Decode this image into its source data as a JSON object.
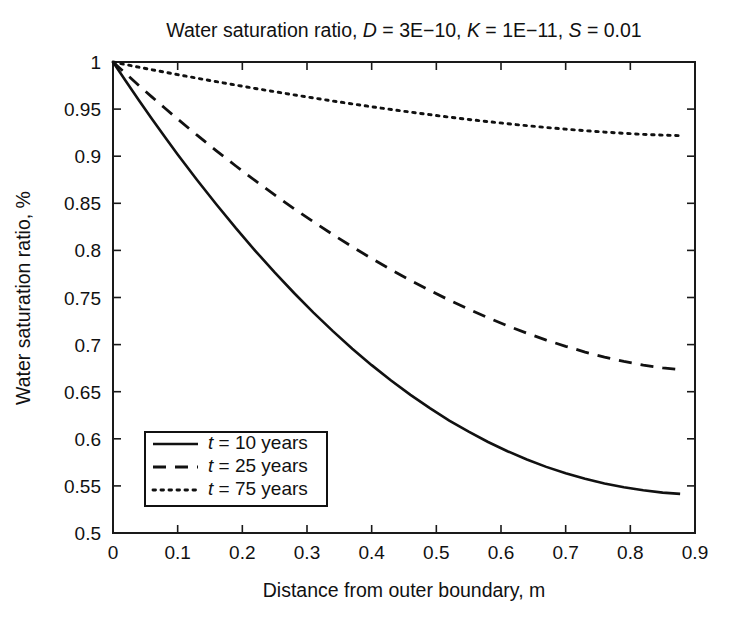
{
  "chart_data": {
    "type": "line",
    "title": "Water saturation ratio, D = 3E−10, K = 1E−11, S = 0.01",
    "title_parts": [
      {
        "text": "Water saturation ratio, ",
        "italic": false
      },
      {
        "text": "D",
        "italic": true
      },
      {
        "text": " = 3E−10, ",
        "italic": false
      },
      {
        "text": "K",
        "italic": true
      },
      {
        "text": " = 1E−11, ",
        "italic": false
      },
      {
        "text": "S",
        "italic": true
      },
      {
        "text": " = 0.01",
        "italic": false
      }
    ],
    "xlabel": "Distance from outer boundary, m",
    "ylabel": "Water saturation ratio, %",
    "xlim": [
      0,
      0.9
    ],
    "ylim": [
      0.5,
      1
    ],
    "xticks": [
      0,
      0.1,
      0.2,
      0.3,
      0.4,
      0.5,
      0.6,
      0.7,
      0.8,
      0.9
    ],
    "xtick_labels": [
      "0",
      "0.1",
      "0.2",
      "0.3",
      "0.4",
      "0.5",
      "0.6",
      "0.7",
      "0.8",
      "0.9"
    ],
    "yticks": [
      0.5,
      0.55,
      0.6,
      0.65,
      0.7,
      0.75,
      0.8,
      0.85,
      0.9,
      0.95,
      1
    ],
    "ytick_labels": [
      "0.5",
      "0.55",
      "0.6",
      "0.65",
      "0.7",
      "0.75",
      "0.8",
      "0.85",
      "0.9",
      "0.95",
      "1"
    ],
    "grid": false,
    "legend_position": "lower-left-inside",
    "x": [
      0,
      0.02,
      0.04,
      0.06,
      0.08,
      0.1,
      0.13,
      0.16,
      0.19,
      0.22,
      0.25,
      0.28,
      0.31,
      0.34,
      0.37,
      0.4,
      0.43,
      0.46,
      0.49,
      0.52,
      0.55,
      0.58,
      0.61,
      0.64,
      0.67,
      0.7,
      0.73,
      0.76,
      0.79,
      0.82,
      0.85,
      0.877
    ],
    "series": [
      {
        "name": "t = 10 years",
        "label_parts": [
          {
            "text": "t",
            "italic": true
          },
          {
            "text": " = 10 years",
            "italic": false
          }
        ],
        "style": "solid",
        "values": [
          1.0,
          0.9795,
          0.9594,
          0.9398,
          0.9206,
          0.9019,
          0.8748,
          0.8487,
          0.8236,
          0.7996,
          0.7766,
          0.7548,
          0.734,
          0.7143,
          0.6957,
          0.6782,
          0.6619,
          0.6466,
          0.6325,
          0.6194,
          0.6075,
          0.5966,
          0.5868,
          0.578,
          0.5702,
          0.5634,
          0.5575,
          0.5525,
          0.5485,
          0.5453,
          0.5429,
          0.5415
        ]
      },
      {
        "name": "t = 25 years",
        "label_parts": [
          {
            "text": "t",
            "italic": true
          },
          {
            "text": " = 25 years",
            "italic": false
          }
        ],
        "style": "dashed",
        "values": [
          1.0,
          0.9875,
          0.9751,
          0.963,
          0.9511,
          0.9394,
          0.9223,
          0.9057,
          0.8896,
          0.874,
          0.8589,
          0.8443,
          0.8303,
          0.8168,
          0.8038,
          0.7914,
          0.7795,
          0.7682,
          0.7574,
          0.7472,
          0.7376,
          0.7285,
          0.72,
          0.7121,
          0.7048,
          0.6982,
          0.6921,
          0.6867,
          0.6821,
          0.6782,
          0.6752,
          0.6735
        ]
      },
      {
        "name": "t = 75 years",
        "label_parts": [
          {
            "text": "t",
            "italic": true
          },
          {
            "text": " = 75 years",
            "italic": false
          }
        ],
        "style": "dotted",
        "values": [
          1.0,
          0.9972,
          0.9945,
          0.9918,
          0.9892,
          0.9866,
          0.9828,
          0.9791,
          0.9755,
          0.9719,
          0.9685,
          0.9651,
          0.9618,
          0.9586,
          0.9555,
          0.9525,
          0.9496,
          0.9468,
          0.9441,
          0.9415,
          0.939,
          0.9367,
          0.9345,
          0.9324,
          0.9305,
          0.9287,
          0.9271,
          0.9256,
          0.9243,
          0.9232,
          0.9223,
          0.9218
        ]
      }
    ]
  },
  "plot_box": {
    "left": 113,
    "right": 695,
    "top": 62,
    "bottom": 533
  },
  "title_position": {
    "x": 404,
    "y": 37
  },
  "xlabel_position": {
    "x": 404,
    "y": 597
  },
  "ylabel_position": {
    "x": 30,
    "y": 298
  },
  "legend": {
    "box": {
      "x": 145,
      "y": 432,
      "width": 182,
      "height": 74
    },
    "entry_height": 23,
    "sample_x1": 153,
    "sample_x2": 198,
    "text_x": 208,
    "first_entry_y": 449
  }
}
